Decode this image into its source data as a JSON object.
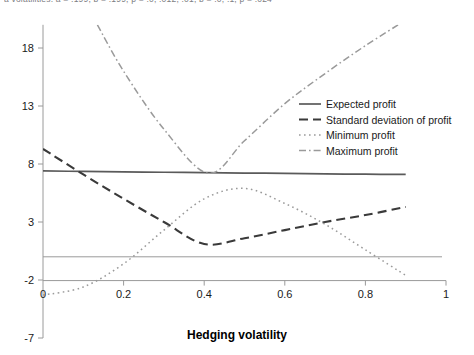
{
  "figure": {
    "clipped_top_caption": "a volatilities: a = .199, b = .199, p = .0, .012, .01, b = .0, .1, p = .024",
    "background_color": "#ffffff"
  },
  "chart_data": {
    "type": "line",
    "title": "",
    "xlabel": "Hedging volatility",
    "ylabel": "",
    "xlim": [
      0,
      1
    ],
    "ylim": [
      -7,
      20
    ],
    "xticks": [
      "0",
      "0.2",
      "0.4",
      "0.6",
      "0.8",
      "1"
    ],
    "xtick_values": [
      0,
      0.2,
      0.4,
      0.6,
      0.8,
      1
    ],
    "yticks": [
      "18",
      "13",
      "8",
      "3",
      "-2",
      "-7"
    ],
    "ytick_values": [
      18,
      13,
      8,
      3,
      -2,
      -7
    ],
    "grid": false,
    "zero_line": true,
    "legend_position": "right-upper",
    "series": [
      {
        "name": "Expected profit",
        "style": "solid",
        "color": "#5a5a5a",
        "x": [
          0,
          0.1,
          0.2,
          0.3,
          0.4,
          0.5,
          0.6,
          0.7,
          0.8,
          0.9
        ],
        "values": [
          7.4,
          7.36,
          7.32,
          7.29,
          7.26,
          7.22,
          7.19,
          7.15,
          7.12,
          7.1
        ]
      },
      {
        "name": "Standard deviation of profit",
        "style": "dashed",
        "color": "#3a3a3a",
        "x": [
          0,
          0.1,
          0.2,
          0.3,
          0.4,
          0.5,
          0.6,
          0.7,
          0.8,
          0.9
        ],
        "values": [
          9.3,
          7.1,
          5.0,
          3.0,
          1.1,
          1.6,
          2.3,
          3.0,
          3.6,
          4.3
        ]
      },
      {
        "name": "Minimum profit",
        "style": "dotted",
        "color": "#9a9a9a",
        "x": [
          0,
          0.1,
          0.2,
          0.3,
          0.4,
          0.5,
          0.6,
          0.7,
          0.8,
          0.9
        ],
        "values": [
          -3.3,
          -2.6,
          -0.6,
          2.3,
          5.0,
          5.9,
          4.6,
          2.8,
          0.6,
          -1.6
        ]
      },
      {
        "name": "Maximum profit",
        "style": "dashdot",
        "color": "#9a9a9a",
        "x": [
          0.135,
          0.2,
          0.3,
          0.41,
          0.5,
          0.6,
          0.7,
          0.8,
          0.9
        ],
        "values": [
          20.0,
          16.0,
          11.0,
          7.2,
          10.0,
          13.2,
          15.8,
          18.2,
          20.4
        ]
      }
    ]
  },
  "legend": {
    "items": [
      {
        "label": "Expected profit",
        "style": "solid"
      },
      {
        "label": "Standard deviation of profit",
        "style": "dashed"
      },
      {
        "label": "Minimum profit",
        "style": "dotted"
      },
      {
        "label": "Maximum profit",
        "style": "dashdot"
      }
    ]
  }
}
